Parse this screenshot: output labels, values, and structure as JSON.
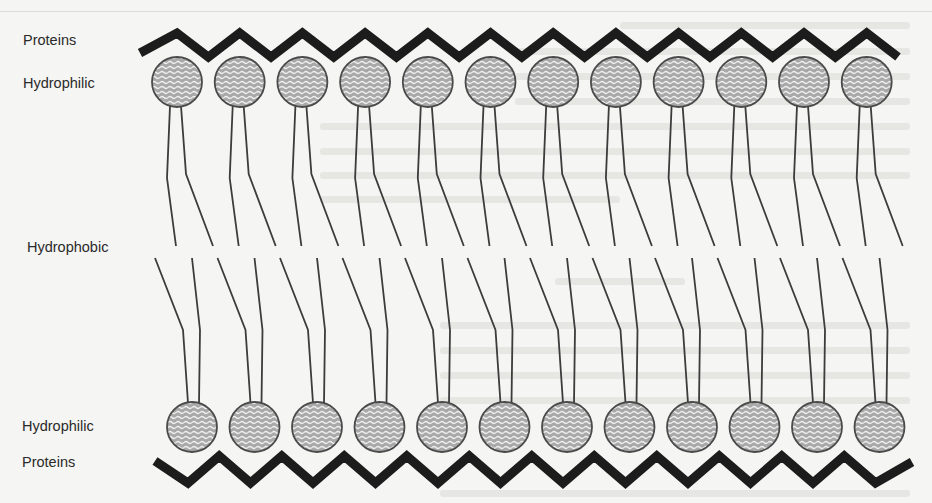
{
  "figure": {
    "labels": {
      "top_proteins": "Proteins",
      "top_hydrophilic": "Hydrophilic",
      "hydrophobic": "Hydrophobic",
      "bottom_hydrophilic": "Hydrophilic",
      "bottom_proteins": "Proteins"
    },
    "colors": {
      "background": "#f5f5f3",
      "protein_band": "#1c1c1c",
      "head_fill": "#a9a9a9",
      "head_stroke": "#4a4a4a",
      "head_wave": "#f0f0f0",
      "tail": "#3c3c3c",
      "label_text": "#2a2a2a"
    },
    "layers": {
      "top": {
        "lipid_count": 12,
        "head_start_x": 177,
        "head_spacing": 62.7,
        "head_center_y": 82,
        "head_radius": 25,
        "protein_band": {
          "start": [
            140,
            53
          ],
          "peak_y": 33,
          "valley_y": 57,
          "end": [
            898,
            57
          ]
        }
      },
      "bottom": {
        "lipid_count": 12,
        "head_start_x": 192,
        "head_spacing": 62.5,
        "head_center_y": 427,
        "head_radius": 25,
        "protein_band": {
          "start": [
            155,
            461
          ],
          "peak_y": 456,
          "valley_y": 483,
          "end": [
            912,
            462
          ]
        }
      }
    }
  }
}
